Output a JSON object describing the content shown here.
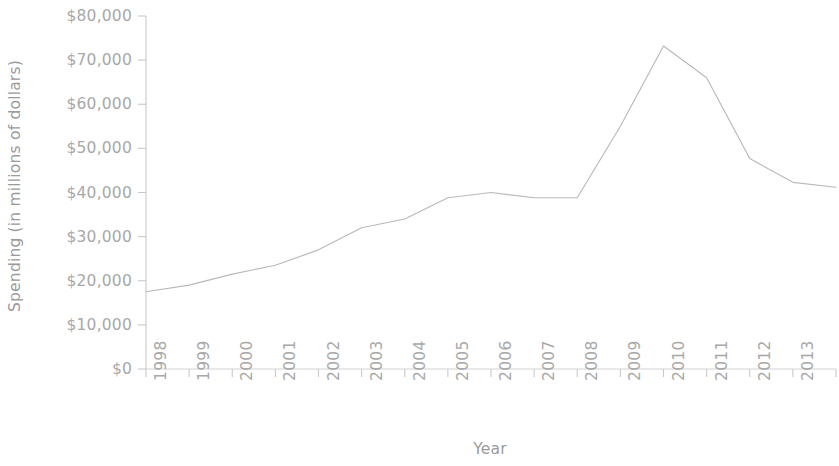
{
  "chart_data": {
    "type": "line",
    "title": "",
    "xlabel": "Year",
    "ylabel": "Spending (in millions of dollars)",
    "x": [
      1998,
      1999,
      2000,
      2001,
      2002,
      2003,
      2004,
      2005,
      2006,
      2007,
      2008,
      2009,
      2010,
      2011,
      2012,
      2013,
      2014
    ],
    "categories": [
      "1998",
      "1999",
      "2000",
      "2001",
      "2002",
      "2003",
      "2004",
      "2005",
      "2006",
      "2007",
      "2008",
      "2009",
      "2010",
      "2011",
      "2012",
      "2013",
      "2014"
    ],
    "values": [
      17500,
      19000,
      21500,
      23500,
      27000,
      32000,
      34000,
      38800,
      40000,
      38800,
      38800,
      55000,
      73200,
      66000,
      47700,
      42300,
      41200
    ],
    "series": [
      {
        "name": "Spending",
        "values": [
          17500,
          19000,
          21500,
          23500,
          27000,
          32000,
          34000,
          38800,
          40000,
          38800,
          38800,
          55000,
          73200,
          66000,
          47700,
          42300,
          41200
        ]
      }
    ],
    "ylim": [
      0,
      80000
    ],
    "xlim": [
      1998,
      2014
    ],
    "ytick_values": [
      0,
      10000,
      20000,
      30000,
      40000,
      50000,
      60000,
      70000,
      80000
    ],
    "ytick_labels": [
      "$0",
      "$10,000",
      "$20,000",
      "$30,000",
      "$40,000",
      "$50,000",
      "$60,000",
      "$70,000",
      "$80,000"
    ],
    "xtick_labels": [
      "1998",
      "1999",
      "2000",
      "2001",
      "2002",
      "2003",
      "2004",
      "2005",
      "2006",
      "2007",
      "2008",
      "2009",
      "2010",
      "2011",
      "2012",
      "2013",
      "2014"
    ],
    "grid": false,
    "legend": "none",
    "line_color": "#b9b9b9",
    "axis_color": "#c9c9c9",
    "text_color": "#a8a8a8",
    "background": "#ffffff"
  },
  "axes": {
    "y_title": "Spending (in millions of dollars)",
    "x_title": "Year"
  }
}
